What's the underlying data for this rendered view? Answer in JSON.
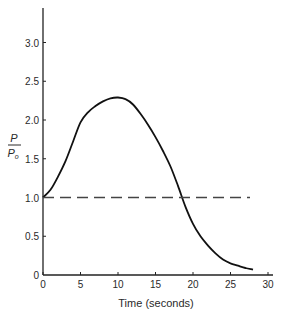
{
  "chart_data": {
    "type": "line",
    "title": "",
    "xlabel": "Time (seconds)",
    "ylabel": "P / P0",
    "ylabel_num": "P",
    "ylabel_den": "P",
    "ylabel_den_sub": "o",
    "xlim": [
      0,
      30
    ],
    "ylim": [
      0,
      3.4
    ],
    "x_ticks": [
      0,
      5,
      10,
      15,
      20,
      25,
      30
    ],
    "x_tick_labels": [
      "0",
      "5",
      "10",
      "15",
      "20",
      "25",
      "30"
    ],
    "y_ticks": [
      0,
      0.5,
      1.0,
      1.5,
      2.0,
      2.5,
      3.0
    ],
    "y_tick_labels": [
      "0",
      "0.5",
      "1.0",
      "1.5",
      "2.0",
      "2.5",
      "3.0"
    ],
    "grid": false,
    "legend": null,
    "series": [
      {
        "name": "P/Po",
        "style": "solid",
        "x": [
          0,
          1,
          2,
          3,
          4,
          5,
          6,
          7,
          8,
          9,
          10,
          11,
          12,
          13,
          14,
          15,
          16,
          17,
          18,
          19,
          20,
          21,
          22,
          23,
          24,
          25,
          26,
          27,
          28
        ],
        "values": [
          1.0,
          1.1,
          1.27,
          1.47,
          1.72,
          1.97,
          2.1,
          2.18,
          2.24,
          2.28,
          2.29,
          2.27,
          2.2,
          2.08,
          1.94,
          1.78,
          1.6,
          1.4,
          1.15,
          0.88,
          0.66,
          0.5,
          0.38,
          0.28,
          0.2,
          0.15,
          0.12,
          0.09,
          0.07
        ]
      },
      {
        "name": "baseline",
        "style": "dashed",
        "x": [
          0,
          27.6
        ],
        "values": [
          1.0,
          1.0
        ]
      }
    ]
  }
}
